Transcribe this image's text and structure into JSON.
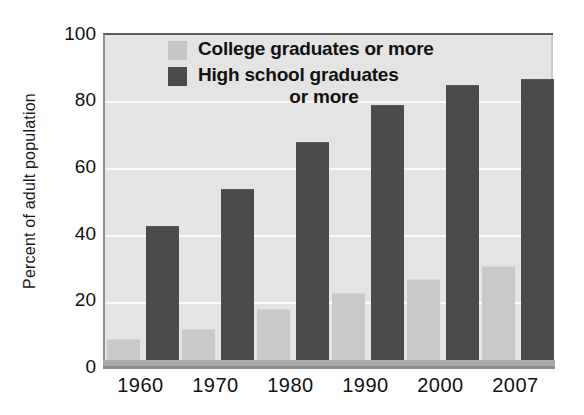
{
  "chart_data": {
    "type": "bar",
    "title": "",
    "xlabel": "",
    "ylabel": "Percent of adult population",
    "categories": [
      "1960",
      "1970",
      "1980",
      "1990",
      "2000",
      "2007"
    ],
    "series": [
      {
        "name": "College graduates or more",
        "color": "#c9c9c9",
        "values": [
          8,
          11,
          17,
          22,
          26,
          30
        ]
      },
      {
        "name": "High school graduates or more",
        "color": "#4b4b4b",
        "values": [
          42,
          53,
          67,
          78,
          84,
          86
        ]
      }
    ],
    "ylim": [
      0,
      100
    ],
    "yticks": [
      0,
      20,
      40,
      60,
      80,
      100
    ],
    "ytick_labels": [
      "0",
      "20",
      "40",
      "60",
      "80",
      "100"
    ],
    "grid": true,
    "grid_axis": "y",
    "legend_position": "inside-top-center",
    "plot_background": "#e4e4e4"
  },
  "legend": {
    "entries": [
      {
        "label": "College graduates or more",
        "label_line1": "College graduates or more",
        "label_line2": ""
      },
      {
        "label": "High school graduates or more",
        "label_line1": "High school graduates",
        "label_line2": "or more"
      }
    ]
  }
}
